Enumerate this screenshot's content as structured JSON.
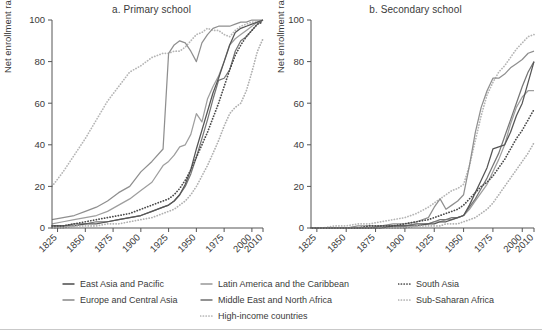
{
  "figure": {
    "y_axis_label": "Net enrollment rate (%)",
    "y_ticks": [
      0,
      20,
      40,
      60,
      80,
      100
    ],
    "x_ticks": [
      1825,
      1850,
      1875,
      1900,
      1925,
      1950,
      1975,
      2000,
      2010
    ],
    "x_range": [
      1820,
      2010
    ],
    "y_range": [
      0,
      100
    ]
  },
  "legend": {
    "columns": [
      {
        "items": [
          {
            "label": "East Asia and Pacific",
            "key": "east_asia_pacific",
            "color": "#555555",
            "style": "solid"
          },
          {
            "label": "Europe and Central Asia",
            "key": "europe_central_asia",
            "color": "#8f8f8f",
            "style": "solid"
          }
        ]
      },
      {
        "items": [
          {
            "label": "Latin America and the Caribbean",
            "key": "latin_america_caribbean",
            "color": "#9e9e9e",
            "style": "solid"
          },
          {
            "label": "Middle East and North Africa",
            "key": "middle_east_north_africa",
            "color": "#767676",
            "style": "solid"
          },
          {
            "label": "High-income countries",
            "key": "high_income_countries",
            "color": "#b5b5b5",
            "style": "dotted"
          }
        ]
      },
      {
        "items": [
          {
            "label": "South Asia",
            "key": "south_asia",
            "color": "#4a4a4a",
            "style": "dotted"
          },
          {
            "label": "Sub-Saharan Africa",
            "key": "sub_saharan_africa",
            "color": "#b0b0b0",
            "style": "dotted"
          }
        ]
      }
    ]
  },
  "chart_data": [
    {
      "id": "panel-a",
      "type": "line",
      "title": "a. Primary school",
      "xlabel": "",
      "ylabel": "Net enrollment rate (%)",
      "xlim": [
        1820,
        2010
      ],
      "ylim": [
        0,
        100
      ],
      "xticks": [
        1825,
        1850,
        1875,
        1900,
        1925,
        1950,
        1975,
        2000,
        2010
      ],
      "yticks": [
        0,
        20,
        40,
        60,
        80,
        100
      ],
      "grid": false,
      "legend_position": "below",
      "x": [
        1820,
        1830,
        1840,
        1850,
        1860,
        1870,
        1880,
        1890,
        1900,
        1910,
        1920,
        1925,
        1930,
        1935,
        1940,
        1945,
        1950,
        1955,
        1960,
        1965,
        1970,
        1975,
        1980,
        1985,
        1990,
        1995,
        2000,
        2005,
        2010
      ],
      "series": [
        {
          "name": "High-income countries",
          "key": "high_income_countries",
          "color": "#b5b5b5",
          "style": "dotted",
          "values": [
            20,
            27,
            35,
            43,
            52,
            61,
            68,
            75,
            78,
            82,
            84,
            84,
            85,
            85,
            87,
            90,
            93,
            94,
            96,
            95,
            95,
            93,
            92,
            95,
            97,
            98,
            99,
            99,
            99
          ]
        },
        {
          "name": "Europe and Central Asia",
          "key": "europe_central_asia",
          "color": "#8f8f8f",
          "style": "solid",
          "values": [
            4,
            5,
            6,
            8,
            10,
            13,
            17,
            20,
            27,
            32,
            38,
            84,
            88,
            90,
            89,
            85,
            80,
            89,
            93,
            96,
            97,
            97,
            97,
            98,
            99,
            99,
            100,
            100,
            100
          ]
        },
        {
          "name": "Latin America and the Caribbean",
          "key": "latin_america_caribbean",
          "color": "#9e9e9e",
          "style": "solid",
          "values": [
            2,
            3,
            4,
            5,
            6,
            8,
            11,
            14,
            18,
            22,
            30,
            32,
            35,
            39,
            40,
            45,
            55,
            51,
            62,
            68,
            73,
            80,
            88,
            91,
            93,
            95,
            97,
            99,
            100
          ]
        },
        {
          "name": "Middle East and North Africa",
          "key": "middle_east_north_africa",
          "color": "#767676",
          "style": "solid",
          "values": [
            1,
            1,
            2,
            2,
            3,
            3,
            4,
            5,
            6,
            8,
            10,
            11,
            13,
            16,
            20,
            26,
            34,
            43,
            52,
            62,
            71,
            72,
            76,
            85,
            90,
            92,
            95,
            98,
            100
          ]
        },
        {
          "name": "East Asia and Pacific",
          "key": "east_asia_pacific",
          "color": "#555555",
          "style": "solid",
          "values": [
            1,
            1,
            1,
            2,
            2,
            3,
            4,
            5,
            6,
            8,
            10,
            11,
            13,
            16,
            21,
            28,
            38,
            47,
            56,
            65,
            72,
            80,
            88,
            94,
            96,
            97,
            98,
            99,
            100
          ]
        },
        {
          "name": "South Asia",
          "key": "south_asia",
          "color": "#4a4a4a",
          "style": "dotted",
          "values": [
            1,
            1,
            2,
            3,
            4,
            5,
            6,
            7,
            9,
            11,
            13,
            14,
            16,
            19,
            23,
            28,
            34,
            40,
            46,
            53,
            60,
            68,
            76,
            83,
            88,
            92,
            95,
            98,
            99
          ]
        },
        {
          "name": "Sub-Saharan Africa",
          "key": "sub_saharan_africa",
          "color": "#b0b0b0",
          "style": "dotted",
          "values": [
            0,
            0,
            1,
            1,
            1,
            2,
            2,
            3,
            4,
            5,
            7,
            8,
            9,
            11,
            13,
            16,
            20,
            25,
            30,
            36,
            42,
            49,
            55,
            58,
            60,
            66,
            75,
            85,
            91
          ]
        }
      ]
    },
    {
      "id": "panel-b",
      "type": "line",
      "title": "b. Secondary school",
      "xlabel": "",
      "ylabel": "Net enrollment rate (%)",
      "xlim": [
        1820,
        2010
      ],
      "ylim": [
        0,
        100
      ],
      "xticks": [
        1825,
        1850,
        1875,
        1900,
        1925,
        1950,
        1975,
        2000,
        2010
      ],
      "yticks": [
        0,
        20,
        40,
        60,
        80,
        100
      ],
      "grid": false,
      "legend_position": "below",
      "x": [
        1820,
        1830,
        1840,
        1850,
        1860,
        1870,
        1880,
        1890,
        1900,
        1910,
        1920,
        1925,
        1930,
        1935,
        1940,
        1945,
        1950,
        1955,
        1960,
        1965,
        1970,
        1975,
        1980,
        1985,
        1990,
        1995,
        2000,
        2005,
        2010
      ],
      "series": [
        {
          "name": "High-income countries",
          "key": "high_income_countries",
          "color": "#b5b5b5",
          "style": "dotted",
          "values": [
            0,
            0,
            1,
            1,
            2,
            2,
            3,
            4,
            5,
            7,
            10,
            12,
            14,
            16,
            18,
            19,
            21,
            30,
            42,
            54,
            64,
            70,
            75,
            78,
            82,
            86,
            89,
            92,
            93
          ]
        },
        {
          "name": "Europe and Central Asia",
          "key": "europe_central_asia",
          "color": "#8f8f8f",
          "style": "solid",
          "values": [
            0,
            0,
            0,
            0,
            1,
            1,
            1,
            2,
            2,
            3,
            5,
            10,
            14,
            9,
            11,
            13,
            16,
            30,
            46,
            58,
            66,
            72,
            72,
            74,
            77,
            79,
            81,
            84,
            85
          ]
        },
        {
          "name": "Latin America and the Caribbean",
          "key": "latin_america_caribbean",
          "color": "#9e9e9e",
          "style": "solid",
          "values": [
            0,
            0,
            0,
            0,
            0,
            0,
            1,
            1,
            1,
            2,
            2,
            3,
            3,
            4,
            4,
            5,
            6,
            9,
            13,
            17,
            21,
            27,
            33,
            40,
            50,
            58,
            63,
            66,
            66
          ]
        },
        {
          "name": "Middle East and North Africa",
          "key": "middle_east_north_africa",
          "color": "#767676",
          "style": "solid",
          "values": [
            0,
            0,
            0,
            0,
            0,
            0,
            1,
            1,
            1,
            2,
            2,
            3,
            4,
            4,
            5,
            5,
            6,
            10,
            14,
            19,
            24,
            30,
            36,
            44,
            52,
            60,
            68,
            75,
            80
          ]
        },
        {
          "name": "East Asia and Pacific",
          "key": "east_asia_pacific",
          "color": "#555555",
          "style": "solid",
          "values": [
            0,
            0,
            0,
            0,
            0,
            0,
            0,
            1,
            1,
            1,
            2,
            2,
            3,
            3,
            4,
            5,
            6,
            11,
            17,
            23,
            29,
            38,
            39,
            40,
            46,
            54,
            60,
            70,
            80
          ]
        },
        {
          "name": "South Asia",
          "key": "south_asia",
          "color": "#4a4a4a",
          "style": "dotted",
          "values": [
            0,
            0,
            0,
            0,
            0,
            1,
            1,
            1,
            2,
            3,
            4,
            5,
            6,
            7,
            8,
            9,
            11,
            14,
            17,
            20,
            22,
            25,
            29,
            33,
            38,
            43,
            47,
            52,
            57
          ]
        },
        {
          "name": "Sub-Saharan Africa",
          "key": "sub_saharan_africa",
          "color": "#b0b0b0",
          "style": "dotted",
          "values": [
            0,
            0,
            0,
            0,
            0,
            0,
            0,
            0,
            0,
            1,
            1,
            1,
            1,
            2,
            2,
            2,
            3,
            4,
            5,
            7,
            9,
            12,
            16,
            20,
            24,
            28,
            32,
            36,
            41
          ]
        }
      ]
    }
  ]
}
